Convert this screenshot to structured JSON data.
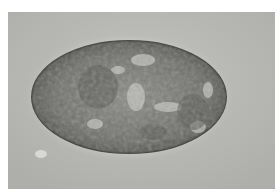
{
  "image": {
    "subject": "micrograph of oval egg/ovum",
    "colors": {
      "background": "#b9b9b7",
      "egg_shell": "#5f5f5c",
      "egg_interior": "#7d7d79",
      "highlight": "#c9c9c5",
      "border": "#ffffff"
    }
  }
}
